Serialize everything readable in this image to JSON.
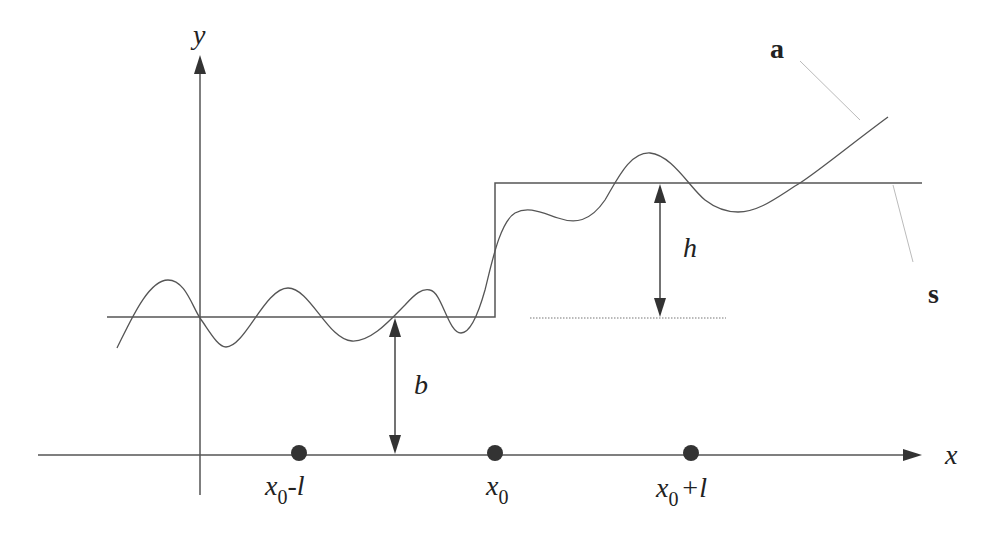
{
  "diagram": {
    "axes": {
      "x_label": "x",
      "y_label": "y"
    },
    "curves": {
      "a_label": "a",
      "s_label": "s"
    },
    "dimensions": {
      "b_label": "b",
      "h_label": "h"
    },
    "ticks": [
      {
        "base": "x",
        "sub": "0",
        "suffix": "-l"
      },
      {
        "base": "x",
        "sub": "0",
        "suffix": ""
      },
      {
        "base": "x",
        "sub": "0",
        "suffix": "+l"
      }
    ],
    "colors": {
      "line": "#555555",
      "dot": "#333333",
      "leader": "#bbbbbb",
      "background": "#ffffff"
    }
  }
}
